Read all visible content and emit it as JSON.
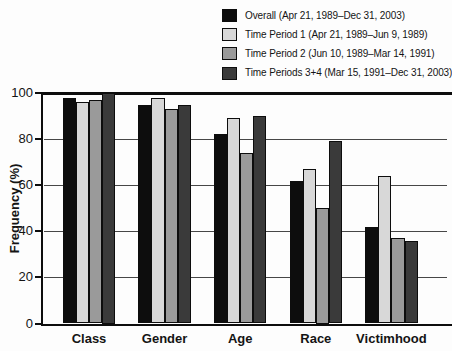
{
  "chart_data": {
    "type": "bar",
    "title": "",
    "xlabel": "",
    "ylabel": "Frequency (%)",
    "ylim": [
      0,
      100
    ],
    "yticks": [
      0,
      20,
      40,
      60,
      80,
      100
    ],
    "grid": true,
    "legend_position": "top-right",
    "categories": [
      "Class",
      "Gender",
      "Age",
      "Race",
      "Victimhood"
    ],
    "series": [
      {
        "name": "Overall (Apr 21, 1989–Dec 31, 2003)",
        "color": "#0d0d0d",
        "values": [
          98,
          95,
          82,
          62,
          42
        ]
      },
      {
        "name": "Time Period 1 (Apr 21, 1989–Jun 9, 1989)",
        "color": "#d8d8d8",
        "values": [
          96,
          98,
          89,
          67,
          64
        ]
      },
      {
        "name": "Time Period 2 (Jun 10, 1989–Mar 14, 1991)",
        "color": "#9a9a9a",
        "values": [
          97,
          93,
          74,
          50,
          37
        ]
      },
      {
        "name": "Time Periods 3+4 (Mar 15, 1991–Dec 31, 2003)",
        "color": "#3a3a3a",
        "values": [
          100,
          95,
          90,
          79,
          36
        ]
      }
    ]
  }
}
